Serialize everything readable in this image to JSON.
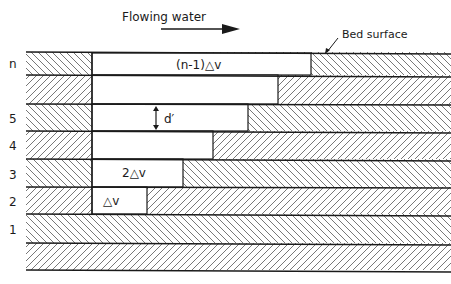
{
  "title": "Flowing water",
  "bed_label": "Bed surface",
  "layer_labels": [
    "n",
    "5",
    "4",
    "3",
    "2",
    "1"
  ],
  "block_labels": {
    "top": "(n-1)△v",
    "third": "2△v",
    "bottom": "△v",
    "thickness": "d′"
  },
  "colors": {
    "line": "#1a1a1a",
    "hatch": "#555555",
    "background": "#ffffff"
  }
}
